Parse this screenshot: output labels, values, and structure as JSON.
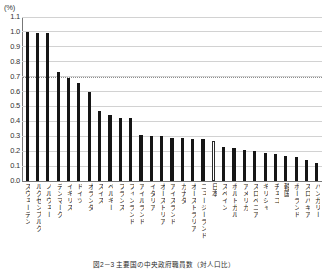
{
  "figure": {
    "unit_label": "(%)",
    "caption": "図2－3 主要国の中央政府職員数（対人口比）"
  },
  "chart_data": {
    "type": "bar",
    "title": "",
    "subtitle": "",
    "xlabel": "",
    "ylabel": "(%)",
    "ylim": [
      0.0,
      1.1
    ],
    "ytick_step": 0.1,
    "grid": true,
    "legend": null,
    "bar_color": "#151515",
    "highlight_color": "#ffffff",
    "highlight_category": "日本",
    "reference_line": {
      "value": 0.7,
      "style": "dotted",
      "color": "#8d8d8d"
    },
    "ytick_labels": [
      "0.0",
      "0.1",
      "0.2",
      "0.3",
      "0.4",
      "0.5",
      "0.6",
      "0.7",
      "0.8",
      "0.9",
      "1.0",
      "1.1"
    ],
    "categories": [
      "スウェーデン",
      "ルクセンブルク",
      "ノルウェー",
      "デンマーク",
      "イギリス",
      "ドイツ",
      "オランダ",
      "スイス",
      "ベルギー",
      "フランス",
      "フィンランド",
      "アイルランド",
      "イタリア",
      "オーストリア",
      "アイスランド",
      "カナダ",
      "オーストラリア",
      "ニュージーランド",
      "日本",
      "スペイン",
      "ポルトガル",
      "アメリカ",
      "スロベニア",
      "ギリシャ",
      "チェコ",
      "韓国",
      "ポーランド",
      "スロバキア",
      "ハンガリー"
    ],
    "values": [
      1.0,
      0.99,
      0.99,
      0.73,
      0.69,
      0.66,
      0.6,
      0.47,
      0.44,
      0.42,
      0.42,
      0.31,
      0.3,
      0.3,
      0.29,
      0.29,
      0.28,
      0.28,
      0.27,
      0.23,
      0.22,
      0.21,
      0.2,
      0.19,
      0.18,
      0.17,
      0.16,
      0.14,
      0.12
    ]
  }
}
